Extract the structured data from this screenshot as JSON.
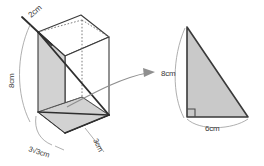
{
  "figure": {
    "colors": {
      "face_fill": "#d2d2d2",
      "face_fill_light": "#dcdcdc",
      "edge_dark": "#2f2f2f",
      "edge_medium": "#555555",
      "edge_hidden": "#6e6e6e",
      "leader_line": "#8a8a8a",
      "arrow": "#8a8a8a",
      "background": "#ffffff",
      "label_text": "#3a3a3a"
    },
    "prism": {
      "name": "triangular-prism",
      "labels": {
        "top_edge": "2cm",
        "height": "8cm",
        "base_long": "3√3cm",
        "base_short": "3cm"
      }
    },
    "cross_section": {
      "name": "right-triangle-cross-section",
      "labels": {
        "vertical_leg": "8cm",
        "horizontal_leg": "6cm"
      },
      "right_angle_marker": true
    },
    "arrow": {
      "name": "callout-arrow",
      "direction": "right"
    }
  }
}
